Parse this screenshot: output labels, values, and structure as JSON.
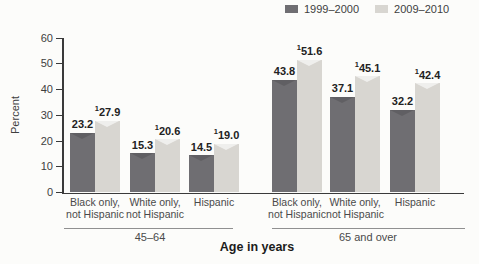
{
  "chart_data": {
    "type": "bar",
    "title": "",
    "ylabel": "Percent",
    "xlabel": "Age in years",
    "ylim": [
      0,
      60
    ],
    "yticks": [
      0,
      10,
      20,
      30,
      40,
      50,
      60
    ],
    "grid": false,
    "legend_position": "top-right",
    "footnote_marker": "1",
    "series": [
      {
        "name": "1999–2000",
        "color": "#6f6e72"
      },
      {
        "name": "2009–2010",
        "color": "#d8d6d1"
      }
    ],
    "groups": [
      {
        "label": "45–64",
        "categories": [
          {
            "label_lines": [
              "Black only,",
              "not Hispanic"
            ],
            "values": [
              23.2,
              27.9
            ],
            "value_labels": [
              "23.2",
              "27.9"
            ],
            "footnotes": [
              false,
              true
            ]
          },
          {
            "label_lines": [
              "White only,",
              "not Hispanic"
            ],
            "values": [
              15.3,
              20.6
            ],
            "value_labels": [
              "15.3",
              "20.6"
            ],
            "footnotes": [
              false,
              true
            ]
          },
          {
            "label_lines": [
              "Hispanic"
            ],
            "values": [
              14.5,
              19.0
            ],
            "value_labels": [
              "14.5",
              "19.0"
            ],
            "footnotes": [
              false,
              true
            ]
          }
        ]
      },
      {
        "label": "65 and over",
        "categories": [
          {
            "label_lines": [
              "Black only,",
              "not Hispanic"
            ],
            "values": [
              43.8,
              51.6
            ],
            "value_labels": [
              "43.8",
              "51.6"
            ],
            "footnotes": [
              false,
              true
            ]
          },
          {
            "label_lines": [
              "White only,",
              "not Hispanic"
            ],
            "values": [
              37.1,
              45.1
            ],
            "value_labels": [
              "37.1",
              "45.1"
            ],
            "footnotes": [
              false,
              true
            ]
          },
          {
            "label_lines": [
              "Hispanic"
            ],
            "values": [
              32.2,
              42.4
            ],
            "value_labels": [
              "32.2",
              "42.4"
            ],
            "footnotes": [
              false,
              true
            ]
          }
        ]
      }
    ]
  }
}
